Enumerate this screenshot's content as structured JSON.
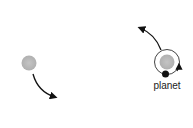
{
  "diagram": {
    "labels": {
      "planet": "planet"
    },
    "colors": {
      "star": "#b8b8b8",
      "planet": "#111111",
      "arrow": "#111111",
      "orbit": "#333333"
    },
    "elements": [
      {
        "name": "left-star",
        "type": "star"
      },
      {
        "name": "left-motion-arrow",
        "type": "arrow"
      },
      {
        "name": "right-star",
        "type": "star"
      },
      {
        "name": "orbit",
        "type": "orbit"
      },
      {
        "name": "planet",
        "type": "planet"
      },
      {
        "name": "right-motion-arrow",
        "type": "arrow"
      }
    ]
  }
}
